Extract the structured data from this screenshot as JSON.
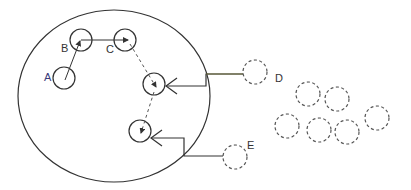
{
  "diagram": {
    "boundary": {
      "cx": 114,
      "cy": 96,
      "rx": 96,
      "ry": 86
    },
    "inner_nodes": [
      {
        "id": "A",
        "label": "A",
        "cx": 64,
        "cy": 78,
        "r": 11,
        "label_x": 44,
        "label_y": 72
      },
      {
        "id": "B",
        "label": "B",
        "cx": 81,
        "cy": 40,
        "r": 11,
        "label_x": 61,
        "label_y": 43
      },
      {
        "id": "C",
        "label": "C",
        "cx": 125,
        "cy": 40,
        "r": 11,
        "label_x": 106,
        "label_y": 44
      },
      {
        "id": "N4",
        "label": "",
        "cx": 154,
        "cy": 84,
        "r": 11
      },
      {
        "id": "N5",
        "label": "",
        "cx": 140,
        "cy": 131,
        "r": 11
      }
    ],
    "outer_nodes": [
      {
        "id": "D",
        "label": "D",
        "cx": 255,
        "cy": 72,
        "r": 12,
        "label_x": 275,
        "label_y": 73
      },
      {
        "id": "E",
        "label": "E",
        "cx": 235,
        "cy": 157,
        "r": 12,
        "label_x": 247,
        "label_y": 140
      },
      {
        "id": "F1",
        "label": "",
        "cx": 308,
        "cy": 94,
        "r": 12
      },
      {
        "id": "F2",
        "label": "",
        "cx": 337,
        "cy": 99,
        "r": 12
      },
      {
        "id": "F3",
        "label": "",
        "cx": 287,
        "cy": 126,
        "r": 12
      },
      {
        "id": "F4",
        "label": "",
        "cx": 319,
        "cy": 130,
        "r": 12
      },
      {
        "id": "F5",
        "label": "",
        "cx": 347,
        "cy": 132,
        "r": 12
      },
      {
        "id": "F6",
        "label": "",
        "cx": 377,
        "cy": 118,
        "r": 12
      }
    ],
    "edges": [
      {
        "from": "A",
        "to": "B",
        "style": "solid"
      },
      {
        "from": "B",
        "to": "C",
        "style": "solid"
      },
      {
        "from": "C",
        "to": "N4",
        "style": "dashed"
      },
      {
        "from": "N4",
        "to": "N5",
        "style": "dashed"
      },
      {
        "from": "D",
        "to": "N4",
        "style": "solid-elbow"
      },
      {
        "from": "E",
        "to": "N5",
        "style": "solid-elbow"
      }
    ],
    "colors": {
      "stroke": "#333333",
      "d_line": "#6b6b3a",
      "dashed": "#555555",
      "label_a": "#3a3a7a"
    }
  }
}
